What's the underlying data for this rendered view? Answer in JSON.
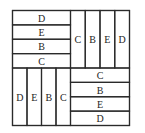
{
  "diagram": {
    "title": "",
    "quadrants": [
      {
        "name": "top-left",
        "orientation": "horizontal",
        "strips": [
          "D",
          "E",
          "B",
          "C"
        ]
      },
      {
        "name": "top-right",
        "orientation": "vertical",
        "strips": [
          "C",
          "B",
          "E",
          "D"
        ]
      },
      {
        "name": "bottom-left",
        "orientation": "vertical",
        "strips": [
          "D",
          "E",
          "B",
          "C"
        ]
      },
      {
        "name": "bottom-right",
        "orientation": "horizontal",
        "strips": [
          "C",
          "B",
          "E",
          "D"
        ]
      }
    ]
  }
}
